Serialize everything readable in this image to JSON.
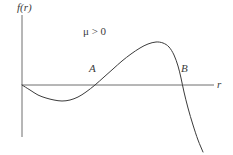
{
  "figure": {
    "axis_labels": {
      "y": "f(r)",
      "x": "r"
    },
    "annotation": {
      "symbol": "μ",
      "relation": " > 0",
      "full": "μ > 0"
    },
    "points": [
      {
        "label": "A",
        "meaning": "first positive root of f(r)"
      },
      {
        "label": "B",
        "meaning": "second positive root of f(r)"
      }
    ],
    "colors": {
      "curve": "#3b3b3b",
      "axis": "#6e6e6e",
      "text": "#3b3b3b",
      "background": "#ffffff"
    }
  },
  "chart_data": {
    "type": "line",
    "title": "",
    "subtitle": "",
    "xlabel": "r",
    "ylabel": "f(r)",
    "legend": [],
    "grid": false,
    "annotations": [
      {
        "text": "μ > 0",
        "x_px": 83,
        "y_px": 26
      },
      {
        "text": "A",
        "x_px": 89,
        "y_px": 63
      },
      {
        "text": "B",
        "x_px": 181,
        "y_px": 63
      }
    ],
    "axes": {
      "x_axis_y_px": 85,
      "x_axis_start_px": 22,
      "x_axis_end_px": 214,
      "y_axis_x_px": 22,
      "y_axis_top_px": 15,
      "y_axis_bottom_px": 137,
      "arrowheads": false
    },
    "series": [
      {
        "name": "f(r)",
        "description": "cubic-like curve: starts at origin, dips to a negative minimum, rises through root A to a positive maximum, then falls steeply through root B",
        "points_px": [
          [
            22,
            85
          ],
          [
            30,
            90
          ],
          [
            38,
            95
          ],
          [
            46,
            98
          ],
          [
            54,
            100
          ],
          [
            62,
            101
          ],
          [
            70,
            100
          ],
          [
            78,
            97
          ],
          [
            86,
            92
          ],
          [
            95,
            85
          ],
          [
            104,
            77
          ],
          [
            113,
            69
          ],
          [
            122,
            61
          ],
          [
            131,
            54
          ],
          [
            140,
            48
          ],
          [
            148,
            44
          ],
          [
            156,
            42
          ],
          [
            163,
            43
          ],
          [
            169,
            47
          ],
          [
            174,
            55
          ],
          [
            178,
            66
          ],
          [
            181,
            78
          ],
          [
            184,
            92
          ],
          [
            188,
            108
          ],
          [
            193,
            125
          ],
          [
            198,
            140
          ],
          [
            203,
            152
          ]
        ],
        "key_features": {
          "origin_crossing_px": [
            22,
            85
          ],
          "minimum_px": [
            62,
            101
          ],
          "root_A_px": [
            95,
            85
          ],
          "maximum_px": [
            156,
            42
          ],
          "root_B_px": [
            180,
            85
          ]
        }
      }
    ]
  }
}
